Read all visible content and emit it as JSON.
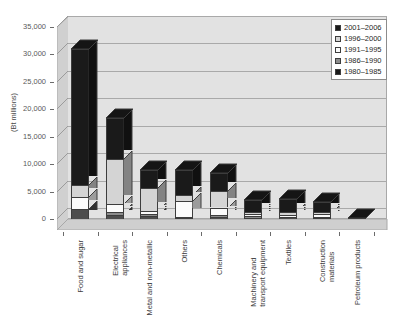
{
  "chart_data": {
    "type": "bar",
    "subtype": "stacked-column-3d",
    "title": "",
    "subtitle": "",
    "xlabel": "",
    "ylabel": "(Bt millions)",
    "ylim": [
      0,
      35000
    ],
    "ytick_step": 5000,
    "grid": true,
    "legend_position": "top-right",
    "ytick_labels": [
      "35,000",
      "30,000",
      "25,000",
      "20,000",
      "15,000",
      "10,000",
      "5,000",
      "0"
    ],
    "ytick_values": [
      35000,
      30000,
      25000,
      20000,
      15000,
      10000,
      5000,
      0
    ],
    "categories": [
      "Food and sugar",
      "Electrical appliances",
      "Metal and non-metallic",
      "Others",
      "Chemicals",
      "Machinery and transport equipment",
      "Textiles",
      "Construction materials",
      "Petroleum products"
    ],
    "category_lines": [
      [
        "Food and sugar"
      ],
      [
        "Electrical",
        "appliances"
      ],
      [
        "Metal and non-metallic"
      ],
      [
        "Others"
      ],
      [
        "Chemicals"
      ],
      [
        "Machinery and",
        "transport equipment"
      ],
      [
        "Textiles"
      ],
      [
        "Construction",
        "materials"
      ],
      [
        "Petroleum products"
      ]
    ],
    "series": [
      {
        "name": "1980–1985",
        "color": "#4d4d4d",
        "values": [
          1800,
          700,
          500,
          150,
          400,
          250,
          300,
          250,
          60
        ]
      },
      {
        "name": "1986–1990",
        "color": "#8c8c8c",
        "values": [
          0,
          500,
          400,
          150,
          300,
          250,
          150,
          150,
          0
        ]
      },
      {
        "name": "1991–1995",
        "color": "#fbfbfb",
        "values": [
          2200,
          1500,
          600,
          3000,
          1400,
          400,
          300,
          500,
          0
        ]
      },
      {
        "name": "1996–2000",
        "color": "#d4d4d4",
        "values": [
          2200,
          8300,
          4200,
          1000,
          3000,
          400,
          500,
          300,
          0
        ]
      },
      {
        "name": "2001–2006",
        "color": "#1a1a1a",
        "values": [
          24800,
          7500,
          3300,
          4700,
          3200,
          2200,
          2450,
          1900,
          40
        ]
      }
    ],
    "totals": [
      31000,
      18500,
      9000,
      9000,
      8300,
      3500,
      3700,
      3100,
      100
    ],
    "legend_entries": [
      {
        "label": "2001–2006",
        "color": "#1a1a1a"
      },
      {
        "label": "1996–2000",
        "color": "#d4d4d4"
      },
      {
        "label": "1991–1995",
        "color": "#fbfbfb"
      },
      {
        "label": "1986–1990",
        "color": "#8c8c8c"
      },
      {
        "label": "1980–1985",
        "color": "#1a1a1a"
      }
    ]
  },
  "colors": {
    "plot_background": "#e2e2e2",
    "gridline": "#a9a9a9",
    "axis": "#6b6b6b",
    "text": "#3d3d3d",
    "page_background": "#ffffff"
  }
}
